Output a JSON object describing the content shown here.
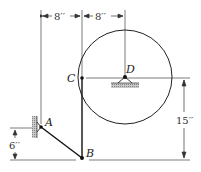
{
  "figure": {
    "points": {
      "A": "A",
      "B": "B",
      "C": "C",
      "D": "D"
    },
    "dimensions": {
      "left_horizontal": "8′′",
      "right_horizontal": "8′′",
      "vertical_right": "15′′",
      "vertical_left": "6′′"
    },
    "colors": {
      "line": "#222222",
      "hatch": "#9a9a9a"
    }
  }
}
